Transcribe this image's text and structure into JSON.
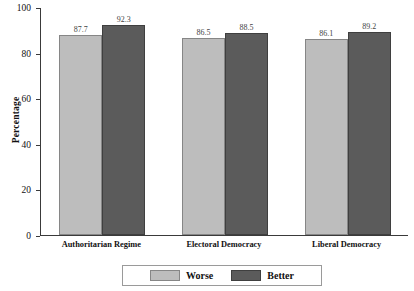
{
  "chart_data": {
    "type": "bar",
    "title": "",
    "xlabel": "",
    "ylabel": "Percentage",
    "ylim": [
      0,
      100
    ],
    "yticks": [
      0,
      20,
      40,
      60,
      80,
      100
    ],
    "ytick_labels": [
      "0",
      "20",
      "40",
      "60",
      "80",
      "100"
    ],
    "grid": false,
    "legend_position": "bottom",
    "categories": [
      "Authoritarian Regime",
      "Electoral Democracy",
      "Liberal Democracy"
    ],
    "series": [
      {
        "name": "Worse",
        "color": "#bdbdbd",
        "values": [
          87.7,
          86.5,
          86.1
        ],
        "labels": [
          "87.7",
          "86.5",
          "86.1"
        ]
      },
      {
        "name": "Better",
        "color": "#5b5b5b",
        "values": [
          92.3,
          88.5,
          89.2
        ],
        "labels": [
          "92.3",
          "88.5",
          "89.2"
        ]
      }
    ]
  },
  "axis": {
    "y_title": "Percentage"
  },
  "legend": {
    "items": [
      {
        "label": "Worse"
      },
      {
        "label": "Better"
      }
    ]
  }
}
